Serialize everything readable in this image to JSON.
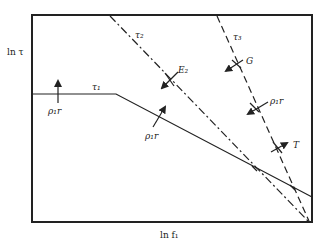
{
  "diagram": {
    "axes": {
      "y_label": "ln τ",
      "x_label": "ln f₁"
    },
    "curves": [
      {
        "id": "tau1",
        "label": "τ₁",
        "style": "solid"
      },
      {
        "id": "tau2",
        "label": "τ₂",
        "style": "dash-dot"
      },
      {
        "id": "tau3",
        "label": "τ₃",
        "style": "dashed"
      }
    ],
    "arrow_labels": {
      "rho_left": "ρ₁r",
      "rho_mid": "ρ₁r",
      "rho_right": "ρ₁r",
      "e2": "E₂",
      "g": "G",
      "t": "T"
    }
  }
}
